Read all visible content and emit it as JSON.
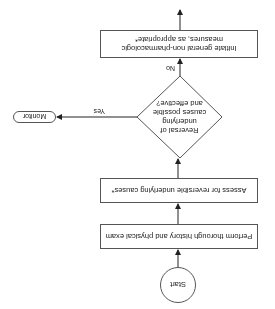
{
  "orientation": "rotated 180 degrees",
  "flowchart": {
    "start": {
      "label": "Start"
    },
    "steps": [
      {
        "label": "Perform thorough history and physical exam"
      },
      {
        "label": "Assess for reversible underlying causes*"
      }
    ],
    "decision": {
      "label": "Reversal of underlying causes possible and effective?"
    },
    "branches": {
      "yes": {
        "label": "Yes",
        "target": "Monitor"
      },
      "no": {
        "label": "No",
        "target": "Initiate general non-pharmacologic measures, as appropriate*"
      }
    },
    "monitor": {
      "label": "Monitor"
    },
    "final_step": {
      "label": "Initiate general non-pharmacologic measures, as appropriate*"
    }
  }
}
